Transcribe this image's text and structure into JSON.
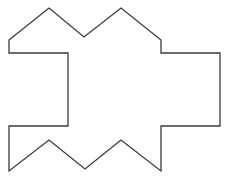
{
  "diagram": {
    "type": "polygon-outline",
    "background": "#ffffff",
    "stroke_color": "#3a3a3a",
    "stroke_width": 1.3,
    "shape": {
      "name": "notched-polygon",
      "points": [
        [
          9,
          40
        ],
        [
          49,
          8
        ],
        [
          84,
          37
        ],
        [
          121,
          8
        ],
        [
          161,
          40
        ],
        [
          161,
          53
        ],
        [
          220,
          53
        ],
        [
          220,
          126
        ],
        [
          161,
          126
        ],
        [
          161,
          171
        ],
        [
          121,
          140
        ],
        [
          85,
          169
        ],
        [
          49,
          140
        ],
        [
          9,
          171
        ],
        [
          9,
          126
        ],
        [
          68,
          126
        ],
        [
          68,
          53
        ],
        [
          9,
          53
        ]
      ]
    }
  }
}
